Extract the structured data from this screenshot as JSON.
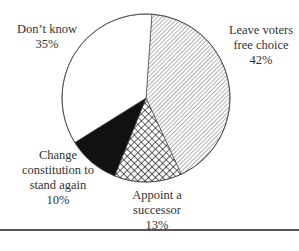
{
  "chart_data": {
    "type": "pie",
    "title": "",
    "slices": [
      {
        "label": "Leave voters free choice",
        "value": 42,
        "pattern": "diagonal-hatch"
      },
      {
        "label": "Appoint a successor",
        "value": 13,
        "pattern": "crosshatch"
      },
      {
        "label": "Change constitution to stand again",
        "value": 10,
        "pattern": "solid-black"
      },
      {
        "label": "Don't know",
        "value": 35,
        "pattern": "white"
      }
    ],
    "labels": [
      {
        "lines": [
          "Leave voters",
          "free choice",
          "42%"
        ]
      },
      {
        "lines": [
          "Appoint a",
          "successor",
          "13%"
        ]
      },
      {
        "lines": [
          "Change",
          "constitution to",
          "stand again",
          "10%"
        ]
      },
      {
        "lines": [
          "Don’t know",
          "35%"
        ]
      }
    ]
  },
  "labels": {
    "leave": {
      "l1": "Leave voters",
      "l2": "free choice",
      "pct": "42%"
    },
    "appoint": {
      "l1": "Appoint a",
      "l2": "successor",
      "pct": "13%"
    },
    "change": {
      "l1": "Change",
      "l2": "constitution to",
      "l3": "stand again",
      "pct": "10%"
    },
    "dontknow": {
      "l1": "Don’t know",
      "pct": "35%"
    }
  }
}
